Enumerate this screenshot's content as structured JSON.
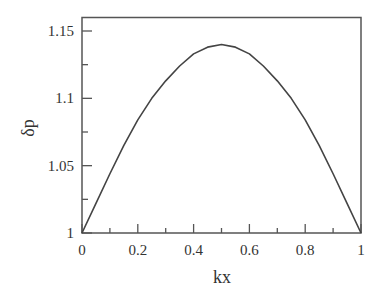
{
  "chart_data": {
    "type": "line",
    "title": "",
    "xlabel": "kx",
    "ylabel": "δp",
    "xlim": [
      0,
      1
    ],
    "ylim": [
      1,
      1.15
    ],
    "grid": false,
    "legend": null,
    "x_ticks": [
      0,
      0.2,
      0.4,
      0.6,
      0.8,
      1
    ],
    "x_tick_labels": [
      "0",
      "0.2",
      "0.4",
      "0.6",
      "0.8",
      "1"
    ],
    "x_minor_ticks": [
      0.1,
      0.3,
      0.5,
      0.7,
      0.9
    ],
    "y_ticks": [
      1,
      1.05,
      1.1,
      1.15
    ],
    "y_tick_labels": [
      "1",
      "1.05",
      "1.1",
      "1.15"
    ],
    "y_minor_ticks": [
      1.025,
      1.075,
      1.125
    ],
    "series": [
      {
        "name": "δp",
        "x": [
          0,
          0.05,
          0.1,
          0.15,
          0.2,
          0.25,
          0.3,
          0.35,
          0.4,
          0.45,
          0.5,
          0.55,
          0.6,
          0.65,
          0.7,
          0.75,
          0.8,
          0.85,
          0.9,
          0.95,
          1
        ],
        "y": [
          1.0,
          1.022,
          1.044,
          1.065,
          1.084,
          1.1,
          1.113,
          1.124,
          1.133,
          1.138,
          1.14,
          1.138,
          1.133,
          1.124,
          1.113,
          1.1,
          1.084,
          1.065,
          1.044,
          1.022,
          1.0
        ]
      }
    ],
    "colors": {
      "line": "#444444",
      "axes": "#555555",
      "text": "#333333",
      "background": "#ffffff"
    }
  }
}
